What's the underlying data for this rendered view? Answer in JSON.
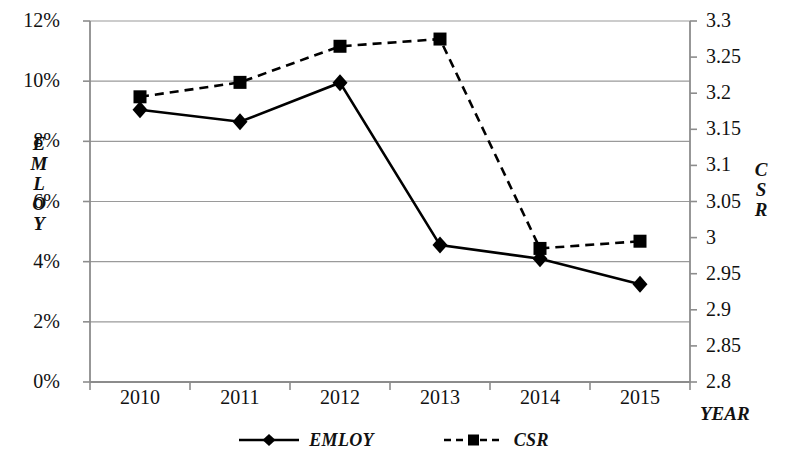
{
  "chart_data": {
    "type": "line",
    "title": "",
    "xlabel": "YEAR",
    "categories": [
      "2010",
      "2011",
      "2012",
      "2013",
      "2014",
      "2015"
    ],
    "grid": true,
    "legend_position": "bottom",
    "axes": {
      "left": {
        "label": "EMLOY",
        "label_letters": [
          "E",
          "M",
          "L",
          "O",
          "Y"
        ],
        "ticks": [
          "0%",
          "2%",
          "4%",
          "6%",
          "8%",
          "10%",
          "12%"
        ],
        "tick_values": [
          0,
          2,
          4,
          6,
          8,
          10,
          12
        ],
        "ylim": [
          0,
          12
        ],
        "unit": "%"
      },
      "right": {
        "label": "CSR",
        "label_letters": [
          "C",
          "S",
          "R"
        ],
        "ticks": [
          "2.8",
          "2.85",
          "2.9",
          "2.95",
          "3",
          "3.05",
          "3.1",
          "3.15",
          "3.2",
          "3.25",
          "3.3"
        ],
        "tick_values": [
          2.8,
          2.85,
          2.9,
          2.95,
          3.0,
          3.05,
          3.1,
          3.15,
          3.2,
          3.25,
          3.3
        ],
        "ylim": [
          2.8,
          3.3
        ]
      }
    },
    "series": [
      {
        "name": "EMLOY",
        "axis": "left",
        "marker": "diamond",
        "line_style": "solid",
        "color": "#000000",
        "values": [
          9.05,
          8.65,
          9.95,
          4.55,
          4.1,
          3.25
        ]
      },
      {
        "name": "CSR",
        "axis": "right",
        "marker": "square",
        "line_style": "dashed",
        "color": "#000000",
        "values": [
          3.195,
          3.215,
          3.265,
          3.275,
          2.985,
          2.995
        ]
      }
    ]
  },
  "legend": {
    "items": [
      {
        "label": "EMLOY",
        "marker": "diamond",
        "line_style": "solid"
      },
      {
        "label": "CSR",
        "marker": "square",
        "line_style": "dashed"
      }
    ]
  }
}
